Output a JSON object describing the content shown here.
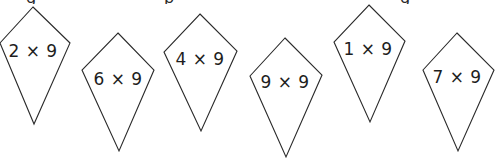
{
  "heading_fragment": {
    "glyphs": [
      {
        "char": "g",
        "x": 26
      },
      {
        "char": "p",
        "x": 164
      },
      {
        "char": "g",
        "x": 400
      }
    ]
  },
  "kites": [
    {
      "label": "2 × 9",
      "points": "33,7 70,43 34,124 0,43",
      "text_x": 33,
      "text_y": 51
    },
    {
      "label": "6 × 9",
      "points": "118,33 154,70 119,151 82,70",
      "text_x": 118,
      "text_y": 79
    },
    {
      "label": "4 × 9",
      "points": "200,14 237,51 201,131 164,52",
      "text_x": 200,
      "text_y": 59
    },
    {
      "label": "9 × 9",
      "points": "285,38 322,75 286,157 250,76",
      "text_x": 285,
      "text_y": 82
    },
    {
      "label": "1 × 9",
      "points": "369,5 405,41 370,122 334,42",
      "text_x": 368,
      "text_y": 49
    },
    {
      "label": "7 × 9",
      "points": "457,33 494,70 458,151 423,70",
      "text_x": 457,
      "text_y": 77
    }
  ],
  "colors": {
    "stroke": "#2a2a2a",
    "text": "#1e1e1e",
    "background": "#ffffff"
  }
}
